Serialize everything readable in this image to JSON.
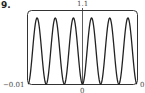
{
  "problem_number": "9.",
  "chart_data": {
    "type": "line",
    "title": "",
    "xlabel": "",
    "ylabel": "",
    "xlim": [
      -0.01,
      0.01
    ],
    "ylim": [
      0,
      1.1
    ],
    "tick_labels": {
      "y_top": "1.1",
      "x_left": "−0.01",
      "x_right": "0",
      "x_bottom_center": "0"
    },
    "periods_visible": 6,
    "peaks": 6,
    "grid": false,
    "colors": {
      "curve": "#222222",
      "frame": "#333333"
    }
  }
}
